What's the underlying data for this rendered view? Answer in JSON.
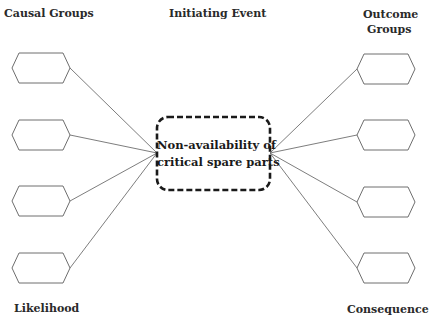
{
  "labels": {
    "causal_groups": "Causal Groups",
    "initiating_event": "Initiating Event",
    "outcome_groups_line1": "Outcome",
    "outcome_groups_line2": "Groups",
    "likelihood": "Likelihood",
    "consequence": "Consequence"
  },
  "center_event": {
    "line1": "Non-availability of",
    "line2": "critical spare parts",
    "border_style": "dashed",
    "border_color": "#1a1a1a"
  },
  "causal_nodes": [
    {
      "id": "cause-1",
      "label": ""
    },
    {
      "id": "cause-2",
      "label": ""
    },
    {
      "id": "cause-3",
      "label": ""
    },
    {
      "id": "cause-4",
      "label": ""
    }
  ],
  "outcome_nodes": [
    {
      "id": "outcome-1",
      "label": ""
    },
    {
      "id": "outcome-2",
      "label": ""
    },
    {
      "id": "outcome-3",
      "label": ""
    },
    {
      "id": "outcome-4",
      "label": ""
    }
  ],
  "colors": {
    "line": "#6e6e6e",
    "hexagon_stroke": "#6e6e6e",
    "text": "#2a2a2a",
    "background": "#ffffff"
  }
}
